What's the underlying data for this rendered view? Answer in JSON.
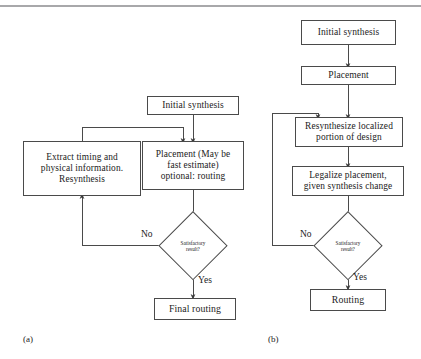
{
  "figure": {
    "background": "#ffffff",
    "line_color": "#4a4a4a",
    "rule_color": "#a8a8aa",
    "text_color": "#1c1c1c"
  },
  "panel_a": {
    "caption": "(a)",
    "nodes": {
      "initial_synthesis": "Initial synthesis",
      "extract": "Extract timing and\nphysical information.\nResynthesis",
      "placement": "Placement (May be\nfast estimate)\noptional: routing",
      "decision": "Satisfactory\nresult?",
      "final_routing": "Final routing"
    },
    "edge_labels": {
      "no": "No",
      "yes": "Yes"
    }
  },
  "panel_b": {
    "caption": "(b)",
    "nodes": {
      "initial_synthesis": "Initial synthesis",
      "placement": "Placement",
      "resynthesize": "Resynthesize localized\nportion of design",
      "legalize": "Legalize placement,\ngiven synthesis change",
      "decision": "Satisfactory\nresult?",
      "routing": "Routing"
    },
    "edge_labels": {
      "no": "No",
      "yes": "Yes"
    }
  }
}
